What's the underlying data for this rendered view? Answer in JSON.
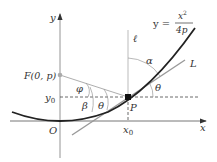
{
  "diagram": {
    "equation": {
      "lhs": "y =",
      "num": "x",
      "exp": "2",
      "den": "4p"
    },
    "axes": {
      "x_label": "x",
      "y_label": "y",
      "origin_label": "O"
    },
    "points": {
      "focus": {
        "label": "F(0, p)"
      },
      "point": {
        "label": "P"
      }
    },
    "ticks": {
      "x0": "x",
      "x0_sub": "0",
      "y0": "y",
      "y0_sub": "0"
    },
    "lines": {
      "vertical": "ℓ",
      "tangent": "L"
    },
    "angles": {
      "alpha": "α",
      "theta1": "θ",
      "theta2": "θ",
      "beta": "β",
      "phi": "φ"
    },
    "colors": {
      "curve": "#222222",
      "axis": "#555555",
      "guide": "#999999",
      "point": "#111111"
    }
  }
}
